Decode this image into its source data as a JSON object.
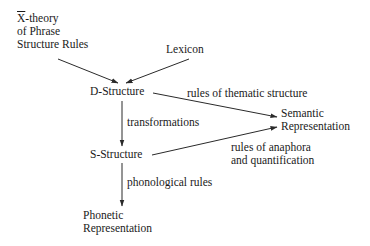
{
  "diagram": {
    "nodes": {
      "xbar_theory": {
        "lines": [
          "X",
          "-theory",
          "of Phrase",
          "Structure Rules"
        ]
      },
      "lexicon": {
        "label": "Lexicon"
      },
      "d_structure": {
        "label": "D-Structure"
      },
      "s_structure": {
        "label": "S-Structure"
      },
      "semantic_rep": {
        "lines": [
          "Semantic",
          "Representation"
        ]
      },
      "phonetic_rep": {
        "lines": [
          "Phonetic",
          "Representation"
        ]
      }
    },
    "edges": {
      "thematic": {
        "label": "rules of thematic structure"
      },
      "transformations": {
        "label": "transformations"
      },
      "anaphora": {
        "lines": [
          "rules of anaphora",
          "and quantification"
        ]
      },
      "phonological": {
        "label": "phonological rules"
      }
    },
    "colors": {
      "text": "#1a1a1a",
      "line": "#2a2a2a",
      "background": "#ffffff"
    }
  }
}
